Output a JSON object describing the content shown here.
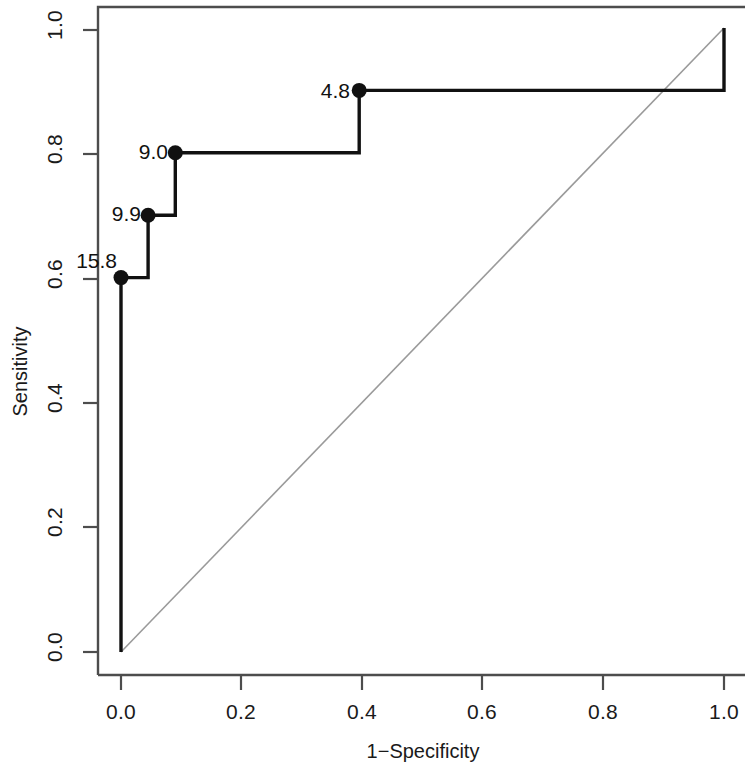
{
  "chart_data": {
    "type": "line",
    "title": "",
    "xlabel": "1−Specificity",
    "ylabel": "Sensitivity",
    "xlim": [
      0.0,
      1.0
    ],
    "ylim": [
      0.0,
      1.0
    ],
    "grid": false,
    "legend": "none",
    "x_ticks": [
      "0.0",
      "0.2",
      "0.4",
      "0.6",
      "0.8",
      "1.0"
    ],
    "x_tick_values": [
      0.0,
      0.2,
      0.4,
      0.6,
      0.8,
      1.0
    ],
    "y_ticks": [
      "0.0",
      "0.2",
      "0.4",
      "0.6",
      "0.8",
      "1.0"
    ],
    "y_tick_values": [
      0.0,
      0.2,
      0.4,
      0.6,
      0.8,
      1.0
    ],
    "series": [
      {
        "name": "ROC curve",
        "style": "step",
        "color": "#111111",
        "x": [
          0.0,
          0.0,
          0.045,
          0.045,
          0.09,
          0.09,
          0.395,
          0.395,
          1.0,
          1.0
        ],
        "y": [
          0.0,
          0.6,
          0.6,
          0.7,
          0.7,
          0.8,
          0.8,
          0.9,
          0.9,
          1.0
        ]
      },
      {
        "name": "Reference diagonal",
        "style": "line",
        "color": "#9a9a9a",
        "x": [
          0.0,
          1.0
        ],
        "y": [
          0.0,
          1.0
        ]
      }
    ],
    "annotated_points": [
      {
        "label": "15.8",
        "x": 0.0,
        "y": 0.6
      },
      {
        "label": "9.9",
        "x": 0.045,
        "y": 0.7
      },
      {
        "label": "9.0",
        "x": 0.09,
        "y": 0.8
      },
      {
        "label": "4.8",
        "x": 0.395,
        "y": 0.9
      }
    ]
  },
  "axes": {
    "x_title": "1−Specificity",
    "y_title": "Sensitivity"
  },
  "colors": {
    "curve": "#111111",
    "diagonal": "#9a9a9a",
    "axis": "#4d4d4d",
    "text": "#1a1a1a",
    "background": "#ffffff"
  }
}
